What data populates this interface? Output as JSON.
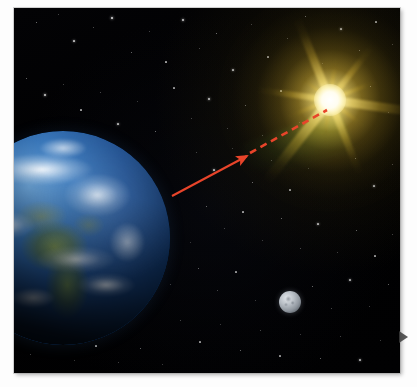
{
  "figure": {
    "title": "Earth, Moon and Sun line-of-sight illustration",
    "background_color": "#ffffff",
    "plate": {
      "name": "space-photograph",
      "background_color": "#010103",
      "border_color": "#a0a0a0",
      "left": 14,
      "top": 8,
      "width": 386,
      "height": 365
    }
  },
  "objects": {
    "earth": {
      "label": "Earth",
      "ocean_color": "#1f4f8f",
      "land_color": "#7e944e",
      "cloud_color": "#ffffff",
      "center_x": 63,
      "center_y": 238,
      "radius": 107
    },
    "moon": {
      "label": "Moon",
      "surface_color": "#b9bfc6",
      "center_x": 290,
      "center_y": 302,
      "radius": 11
    },
    "sun": {
      "label": "Sun",
      "core_color": "#ffffff",
      "ray_color": "#fae276",
      "halo_color": "#e2bc38",
      "center_x": 330,
      "center_y": 100,
      "ray_count": 12
    },
    "scatter_cone": {
      "label": "Green scattered light cone",
      "color": "#80be46"
    }
  },
  "annotations": {
    "sight_arrow": {
      "name": "red-sight-arrow",
      "color": "#e8442a",
      "style": "solid",
      "from_x": 172,
      "from_y": 196,
      "to_x": 247,
      "to_y": 156,
      "head": "arrow"
    },
    "sight_dashed": {
      "name": "red-dashed-sight-line",
      "color": "#e8442a",
      "style": "dashed",
      "dash_pattern": "7 5",
      "from_x": 250,
      "from_y": 153,
      "to_x": 327,
      "to_y": 110
    }
  },
  "edge_marker": {
    "name": "page-edge-triangle",
    "glyph": "play-triangle",
    "color": "#3c3c3c",
    "x": 399,
    "y": 331
  },
  "starfield": {
    "count": 150,
    "color": "#ffffff",
    "stars": [
      [
        36,
        22,
        1.0,
        0.55
      ],
      [
        58,
        14,
        0.8,
        0.4
      ],
      [
        74,
        41,
        1.2,
        0.7
      ],
      [
        93,
        27,
        0.9,
        0.45
      ],
      [
        112,
        18,
        1.4,
        0.8
      ],
      [
        131,
        52,
        1.0,
        0.5
      ],
      [
        149,
        31,
        0.8,
        0.38
      ],
      [
        166,
        62,
        1.1,
        0.62
      ],
      [
        183,
        20,
        1.3,
        0.72
      ],
      [
        199,
        48,
        0.9,
        0.42
      ],
      [
        216,
        33,
        1.0,
        0.55
      ],
      [
        233,
        70,
        1.2,
        0.66
      ],
      [
        251,
        24,
        0.8,
        0.36
      ],
      [
        268,
        57,
        1.1,
        0.58
      ],
      [
        287,
        38,
        0.9,
        0.44
      ],
      [
        305,
        16,
        1.0,
        0.52
      ],
      [
        322,
        63,
        0.8,
        0.34
      ],
      [
        341,
        29,
        1.2,
        0.64
      ],
      [
        359,
        50,
        1.0,
        0.48
      ],
      [
        376,
        22,
        1.1,
        0.58
      ],
      [
        392,
        44,
        0.9,
        0.4
      ],
      [
        26,
        78,
        1.0,
        0.5
      ],
      [
        45,
        95,
        1.3,
        0.74
      ],
      [
        63,
        84,
        0.8,
        0.36
      ],
      [
        81,
        110,
        1.1,
        0.6
      ],
      [
        100,
        92,
        0.9,
        0.44
      ],
      [
        118,
        124,
        1.2,
        0.68
      ],
      [
        137,
        101,
        0.8,
        0.34
      ],
      [
        155,
        131,
        1.0,
        0.54
      ],
      [
        174,
        88,
        1.1,
        0.58
      ],
      [
        191,
        118,
        0.9,
        0.42
      ],
      [
        209,
        99,
        1.3,
        0.7
      ],
      [
        227,
        128,
        0.8,
        0.36
      ],
      [
        245,
        105,
        1.0,
        0.5
      ],
      [
        262,
        135,
        0.9,
        0.44
      ],
      [
        281,
        91,
        1.1,
        0.6
      ],
      [
        299,
        122,
        0.8,
        0.32
      ],
      [
        370,
        86,
        1.0,
        0.52
      ],
      [
        388,
        112,
        0.9,
        0.42
      ],
      [
        22,
        146,
        1.1,
        0.56
      ],
      [
        196,
        152,
        0.9,
        0.4
      ],
      [
        214,
        170,
        1.2,
        0.66
      ],
      [
        232,
        148,
        0.8,
        0.34
      ],
      [
        252,
        182,
        1.0,
        0.52
      ],
      [
        271,
        160,
        0.9,
        0.44
      ],
      [
        290,
        190,
        1.1,
        0.58
      ],
      [
        308,
        168,
        0.8,
        0.34
      ],
      [
        355,
        158,
        1.0,
        0.5
      ],
      [
        374,
        186,
        1.2,
        0.64
      ],
      [
        392,
        164,
        0.9,
        0.42
      ],
      [
        206,
        206,
        1.0,
        0.5
      ],
      [
        224,
        228,
        0.9,
        0.42
      ],
      [
        243,
        212,
        1.1,
        0.6
      ],
      [
        262,
        240,
        0.8,
        0.34
      ],
      [
        281,
        218,
        1.0,
        0.52
      ],
      [
        300,
        248,
        0.9,
        0.44
      ],
      [
        318,
        224,
        1.2,
        0.66
      ],
      [
        337,
        252,
        0.8,
        0.36
      ],
      [
        356,
        230,
        1.0,
        0.5
      ],
      [
        375,
        256,
        1.1,
        0.58
      ],
      [
        392,
        234,
        0.9,
        0.4
      ],
      [
        198,
        268,
        1.0,
        0.48
      ],
      [
        217,
        290,
        0.9,
        0.42
      ],
      [
        236,
        272,
        1.1,
        0.58
      ],
      [
        255,
        300,
        0.8,
        0.34
      ],
      [
        312,
        286,
        1.0,
        0.52
      ],
      [
        331,
        308,
        0.9,
        0.44
      ],
      [
        350,
        280,
        1.2,
        0.64
      ],
      [
        369,
        306,
        0.8,
        0.36
      ],
      [
        388,
        284,
        1.0,
        0.5
      ],
      [
        180,
        320,
        0.9,
        0.42
      ],
      [
        200,
        342,
        1.1,
        0.58
      ],
      [
        220,
        324,
        0.8,
        0.34
      ],
      [
        240,
        350,
        1.0,
        0.5
      ],
      [
        260,
        330,
        0.9,
        0.44
      ],
      [
        280,
        356,
        1.1,
        0.58
      ],
      [
        300,
        334,
        0.8,
        0.34
      ],
      [
        320,
        358,
        1.0,
        0.5
      ],
      [
        340,
        336,
        0.9,
        0.42
      ],
      [
        360,
        360,
        1.2,
        0.64
      ],
      [
        380,
        340,
        0.8,
        0.36
      ],
      [
        30,
        354,
        0.9,
        0.4
      ],
      [
        52,
        342,
        1.0,
        0.48
      ],
      [
        74,
        360,
        0.8,
        0.32
      ],
      [
        96,
        346,
        1.1,
        0.56
      ],
      [
        118,
        362,
        0.9,
        0.4
      ],
      [
        140,
        348,
        1.0,
        0.5
      ],
      [
        162,
        364,
        0.8,
        0.34
      ],
      [
        40,
        176,
        0.8,
        0.3
      ],
      [
        30,
        210,
        0.9,
        0.34
      ],
      [
        190,
        242,
        0.8,
        0.3
      ],
      [
        170,
        284,
        0.9,
        0.36
      ]
    ]
  }
}
